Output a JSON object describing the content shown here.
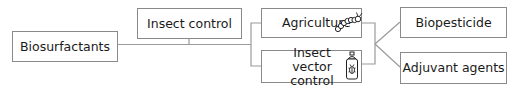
{
  "diagram": {
    "nodes": {
      "root": "Biosurfactants",
      "insect_control": "Insect control",
      "agriculture": "Agriculture",
      "vector_control": "Insect vector control",
      "biopesticide": "Biopesticide",
      "adjuvant": "Adjuvant agents"
    },
    "icons": {
      "agriculture": "caterpillar-icon",
      "vector_control": "insecticide-spray-can-icon"
    },
    "colors": {
      "line": "#9a9a9a",
      "border": "#8a8a8a",
      "text": "#1a1a1a"
    }
  }
}
